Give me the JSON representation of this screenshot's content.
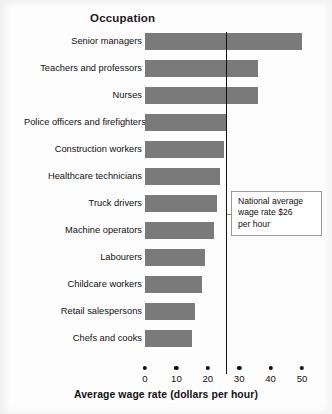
{
  "header": {
    "column_title": "Occupation"
  },
  "annotation": {
    "text": "National average wage rate $26 per hour",
    "line1": "National average",
    "line2": "wage rate $26",
    "line3": "per hour"
  },
  "colors": {
    "bar": "#7a7a7a",
    "reference_line": "#111111",
    "background": "#fdfdfd",
    "text": "#111111",
    "callout_border": "#9a9a9a"
  },
  "chart_data": {
    "type": "bar",
    "orientation": "horizontal",
    "title": "",
    "xlabel": "Average wage rate (dollars per hour)",
    "ylabel": "Occupation",
    "xlim": [
      0,
      50
    ],
    "xticks": [
      0,
      10,
      20,
      30,
      40,
      50
    ],
    "xtick_labels": [
      "0",
      "10",
      "20",
      "30",
      "40",
      "50"
    ],
    "grid": false,
    "legend": "none",
    "categories": [
      "Senior managers",
      "Teachers and professors",
      "Nurses",
      "Police officers and firefighters",
      "Construction workers",
      "Healthcare technicians",
      "Truck drivers",
      "Machine operators",
      "Labourers",
      "Childcare workers",
      "Retail salespersons",
      "Chefs and cooks"
    ],
    "values": [
      50,
      36,
      36,
      26,
      25,
      24,
      23,
      22,
      19,
      18,
      16,
      15
    ],
    "annotations": [
      {
        "type": "reference_line",
        "axis": "x",
        "value": 26,
        "label": "National average wage rate $26 per hour"
      }
    ]
  }
}
